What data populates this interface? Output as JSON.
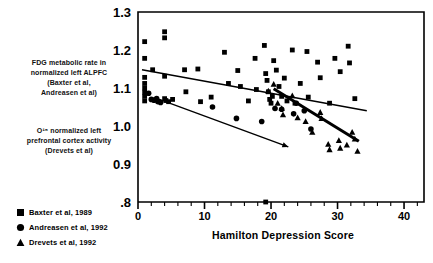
{
  "figure": {
    "y_axis_caption_top": {
      "lines": [
        "FDG metabolic rate in",
        "normalized left ALPFC",
        "(Baxter et al,",
        "Andreasen et al)"
      ]
    },
    "y_axis_caption_bottom": {
      "lines": [
        "O¹⁵ normalized left",
        "prefrontal cortex activity",
        "(Drevets et al)"
      ]
    }
  },
  "legend": {
    "position": "below-left",
    "items": [
      {
        "marker": "square-marker-icon",
        "label": "Baxter et al, 1989"
      },
      {
        "marker": "circle-marker-icon",
        "label": "Andreasen et al, 1992"
      },
      {
        "marker": "triangle-marker-icon",
        "label": "Drevets et al, 1992"
      }
    ]
  },
  "chart_data": {
    "type": "scatter",
    "title": "",
    "xlabel": "Hamilton Depression Score",
    "ylabel": "FDG metabolic rate in normalized left ALPFC (Baxter et al, Andreasen et al) / O¹⁵ normalized left prefrontal cortex activity (Drevets et al)",
    "xlim": [
      0,
      43
    ],
    "ylim": [
      0.8,
      1.3
    ],
    "xticks": [
      0,
      10,
      20,
      30,
      40
    ],
    "xtick_labels": [
      "0",
      "10",
      "20",
      "30",
      "40"
    ],
    "xticks_minor_step": 2,
    "yticks": [
      0.8,
      0.9,
      1.0,
      1.1,
      1.2,
      1.3
    ],
    "ytick_labels": [
      ".8",
      "0.9",
      "1.0",
      "1.1",
      "1.2",
      "1.3"
    ],
    "grid": false,
    "legend_position": "below-left",
    "series": [
      {
        "name": "Baxter et al, 1989",
        "marker": "square",
        "color": "#000000",
        "points": [
          [
            1.0,
            1.222
          ],
          [
            1.0,
            1.178
          ],
          [
            1.0,
            1.128
          ],
          [
            1.0,
            1.112
          ],
          [
            1.0,
            1.1
          ],
          [
            1.0,
            1.089
          ],
          [
            1.0,
            1.078
          ],
          [
            1.0,
            1.066
          ],
          [
            2.2,
            1.148
          ],
          [
            4.0,
            1.248
          ],
          [
            4.0,
            1.232
          ],
          [
            4.0,
            1.131
          ],
          [
            4.0,
            1.072
          ],
          [
            4.2,
            1.067
          ],
          [
            4.6,
            1.064
          ],
          [
            5.2,
            1.07
          ],
          [
            7.0,
            1.148
          ],
          [
            7.2,
            1.09
          ],
          [
            9.0,
            1.15
          ],
          [
            9.4,
            1.064
          ],
          [
            11.0,
            1.076
          ],
          [
            13.0,
            1.194
          ],
          [
            13.6,
            1.112
          ],
          [
            15.0,
            1.146
          ],
          [
            15.4,
            1.104
          ],
          [
            16.6,
            1.066
          ],
          [
            17.6,
            1.178
          ],
          [
            17.8,
            1.096
          ],
          [
            19.0,
            1.212
          ],
          [
            19.2,
            1.138
          ],
          [
            19.4,
            1.12
          ],
          [
            19.6,
            1.09
          ],
          [
            19.8,
            1.07
          ],
          [
            20.0,
            1.06
          ],
          [
            20.2,
            1.078
          ],
          [
            20.4,
            1.172
          ],
          [
            20.8,
            1.147
          ],
          [
            21.2,
            1.104
          ],
          [
            21.6,
            1.078
          ],
          [
            22.0,
            1.126
          ],
          [
            22.4,
            1.066
          ],
          [
            23.2,
            1.2
          ],
          [
            23.6,
            1.06
          ],
          [
            24.4,
            1.112
          ],
          [
            25.4,
            1.196
          ],
          [
            25.6,
            1.076
          ],
          [
            27.0,
            1.168
          ],
          [
            27.4,
            1.127
          ],
          [
            28.8,
            1.06
          ],
          [
            29.6,
            1.178
          ],
          [
            30.4,
            1.143
          ],
          [
            31.6,
            1.21
          ],
          [
            31.8,
            1.166
          ],
          [
            32.6,
            1.072
          ],
          [
            19.2,
            0.8
          ]
        ]
      },
      {
        "name": "Andreasen et al, 1992",
        "marker": "circle",
        "color": "#000000",
        "points": [
          [
            1.6,
            1.086
          ],
          [
            2.0,
            1.07
          ],
          [
            2.4,
            1.068
          ],
          [
            2.8,
            1.072
          ],
          [
            3.0,
            1.064
          ],
          [
            3.4,
            1.062
          ],
          [
            11.2,
            1.05
          ],
          [
            14.8,
            1.02
          ],
          [
            18.6,
            1.012
          ],
          [
            20.6,
            1.046
          ],
          [
            21.6,
            1.044
          ],
          [
            23.4,
            1.032
          ],
          [
            23.8,
            1.06
          ],
          [
            25.0,
            1.04
          ],
          [
            26.0,
            0.992
          ]
        ]
      },
      {
        "name": "Drevets et al, 1992",
        "marker": "triangle",
        "color": "#000000",
        "points": [
          [
            19.6,
            1.092
          ],
          [
            20.4,
            1.11
          ],
          [
            21.0,
            1.06
          ],
          [
            21.6,
            1.046
          ],
          [
            21.8,
            1.03
          ],
          [
            23.2,
            1.08
          ],
          [
            24.0,
            1.022
          ],
          [
            25.2,
            1.012
          ],
          [
            26.2,
            0.984
          ],
          [
            27.4,
            1.036
          ],
          [
            27.6,
            1.02
          ],
          [
            28.6,
            0.952
          ],
          [
            28.8,
            0.938
          ],
          [
            30.2,
            0.962
          ],
          [
            30.4,
            0.942
          ],
          [
            31.4,
            0.95
          ],
          [
            32.2,
            0.984
          ],
          [
            32.6,
            0.966
          ],
          [
            33.0,
            0.934
          ]
        ]
      }
    ],
    "trendlines": [
      {
        "name": "Baxter trend",
        "series": "Baxter et al, 1989",
        "style": "thin",
        "arrow": false,
        "x0": 0.6,
        "y0": 1.148,
        "x1": 34.4,
        "y1": 1.04
      },
      {
        "name": "Andreasen trend",
        "series": "Andreasen et al, 1992",
        "style": "thin",
        "arrow": true,
        "x0": 2.6,
        "y0": 1.074,
        "x1": 22.6,
        "y1": 0.945
      },
      {
        "name": "Drevets trend",
        "series": "Drevets et al, 1992",
        "style": "thick",
        "arrow": false,
        "x0": 20.4,
        "y0": 1.098,
        "x1": 33.2,
        "y1": 0.96
      }
    ]
  }
}
